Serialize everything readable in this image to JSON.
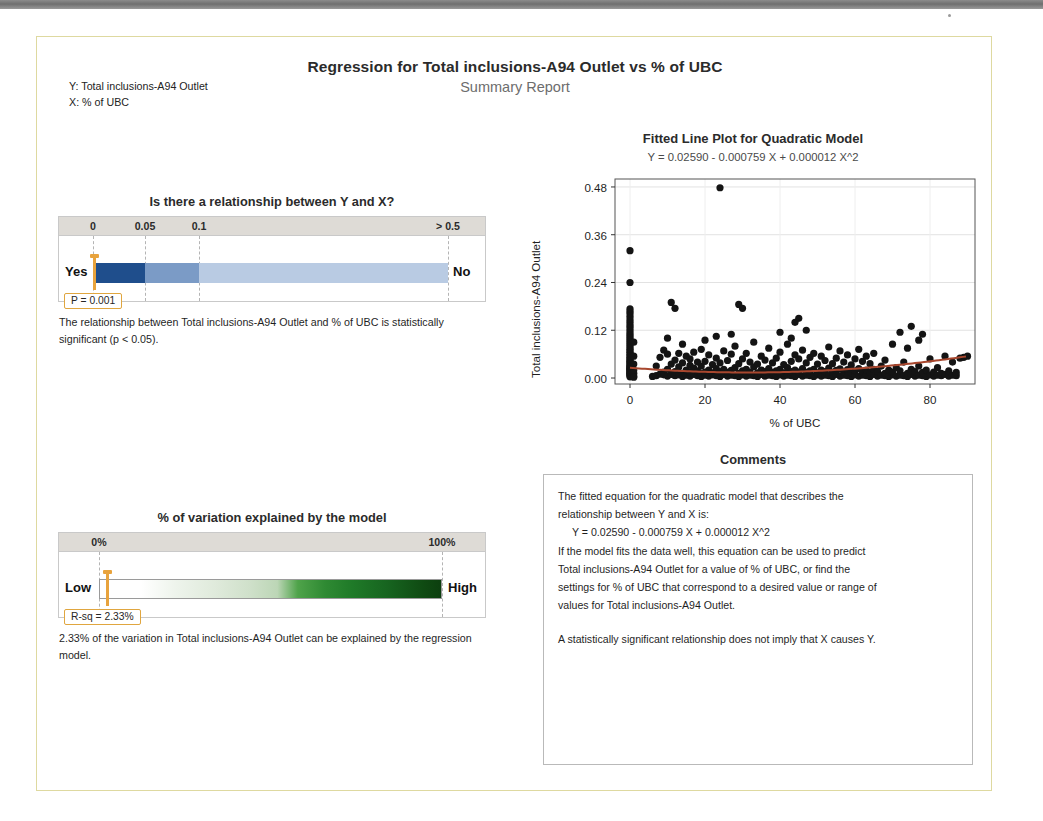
{
  "header": {
    "title": "Regression for Total inclusions-A94 Outlet vs % of UBC",
    "subtitle": "Summary Report",
    "y_label": "Y: Total inclusions-A94 Outlet",
    "x_label": "X: % of UBC"
  },
  "relationship_panel": {
    "title": "Is there a relationship between Y and X?",
    "scale_labels": [
      "0",
      "0.05",
      "0.1",
      "> 0.5"
    ],
    "left_end": "Yes",
    "right_end": "No",
    "callout": "P = 0.001",
    "p_value": 0.001,
    "blurb": "The relationship between Total inclusions-A94 Outlet and % of UBC is statistically significant (p < 0.05).",
    "colors": {
      "segment_dark": "#1f4e8c",
      "segment_mid": "#7b9bc6",
      "segment_light": "#b9cbe3",
      "marker": "#e8a33d",
      "header_band": "#dedbd6"
    }
  },
  "variation_panel": {
    "title": "% of variation explained by the model",
    "scale_labels": [
      "0%",
      "100%"
    ],
    "left_end": "Low",
    "right_end": "High",
    "callout": "R-sq = 2.33%",
    "r_squared_percent": 2.33,
    "blurb": "2.33% of the variation in Total inclusions-A94 Outlet can be explained by the regression model.",
    "colors": {
      "gradient_start": "#ffffff",
      "gradient_end": "#0f4a12",
      "marker": "#e8a33d"
    }
  },
  "comments_panel": {
    "title": "Comments",
    "line1": "The fitted equation for the quadratic model that describes the",
    "line2": "relationship between Y and X is:",
    "equation": "Y = 0.02590 - 0.000759 X + 0.000012 X^2",
    "line3": "If the model fits the data well, this equation can be used to predict",
    "line4": "Total inclusions-A94 Outlet for a value of % of UBC, or find the",
    "line5": "settings for % of UBC that correspond to a desired value or range of",
    "line6": "values for Total inclusions-A94 Outlet.",
    "line7": "A statistically significant relationship does not imply that X causes Y."
  },
  "chart_data": {
    "type": "scatter",
    "title": "Fitted Line Plot for Quadratic Model",
    "subtitle": "Y = 0.02590 - 0.000759 X + 0.000012 X^2",
    "xlabel": "% of UBC",
    "ylabel": "Total inclusions-A94 Outlet",
    "xlim": [
      -4,
      92
    ],
    "ylim": [
      -0.015,
      0.5
    ],
    "xticks": [
      0,
      20,
      40,
      60,
      80
    ],
    "yticks": [
      0.0,
      0.12,
      0.24,
      0.36,
      0.48
    ],
    "ytick_labels": [
      "0.00",
      "0.12",
      "0.24",
      "0.36",
      "0.48"
    ],
    "xtick_labels": [
      "0",
      "20",
      "40",
      "60",
      "80"
    ],
    "grid": true,
    "legend": "none",
    "fit": {
      "kind": "quadratic",
      "intercept": 0.0259,
      "linear": -0.000759,
      "quadratic": 1.2e-05,
      "color": "#a8472e"
    },
    "marker": {
      "shape": "circle",
      "color": "#141414",
      "size": 6
    },
    "points": [
      [
        0,
        0.003
      ],
      [
        0,
        0.006
      ],
      [
        0,
        0.008
      ],
      [
        0,
        0.01
      ],
      [
        0,
        0.012
      ],
      [
        0,
        0.014
      ],
      [
        0,
        0.016
      ],
      [
        0,
        0.018
      ],
      [
        0,
        0.02
      ],
      [
        0,
        0.022
      ],
      [
        0,
        0.024
      ],
      [
        0,
        0.026
      ],
      [
        0,
        0.028
      ],
      [
        0,
        0.03
      ],
      [
        0,
        0.033
      ],
      [
        0,
        0.036
      ],
      [
        0,
        0.039
      ],
      [
        0,
        0.042
      ],
      [
        0,
        0.045
      ],
      [
        0,
        0.048
      ],
      [
        0,
        0.052
      ],
      [
        0,
        0.056
      ],
      [
        0,
        0.06
      ],
      [
        0,
        0.064
      ],
      [
        0,
        0.068
      ],
      [
        0,
        0.072
      ],
      [
        0,
        0.077
      ],
      [
        0,
        0.082
      ],
      [
        0,
        0.087
      ],
      [
        0,
        0.092
      ],
      [
        0,
        0.097
      ],
      [
        0,
        0.102
      ],
      [
        0,
        0.107
      ],
      [
        0,
        0.112
      ],
      [
        0,
        0.118
      ],
      [
        0,
        0.124
      ],
      [
        0,
        0.13
      ],
      [
        0,
        0.136
      ],
      [
        0,
        0.142
      ],
      [
        0,
        0.148
      ],
      [
        0,
        0.155
      ],
      [
        0,
        0.162
      ],
      [
        0,
        0.168
      ],
      [
        0,
        0.174
      ],
      [
        0,
        0.24
      ],
      [
        0,
        0.32
      ],
      [
        1,
        0.005
      ],
      [
        1,
        0.012
      ],
      [
        1,
        0.02
      ],
      [
        1,
        0.035
      ],
      [
        1,
        0.055
      ],
      [
        1,
        0.09
      ],
      [
        1,
        0.002
      ],
      [
        6,
        0.004
      ],
      [
        7,
        0.006
      ],
      [
        7,
        0.03
      ],
      [
        8,
        0.01
      ],
      [
        8,
        0.052
      ],
      [
        9,
        0.008
      ],
      [
        9,
        0.07
      ],
      [
        9,
        0.015
      ],
      [
        10,
        0.005
      ],
      [
        10,
        0.022
      ],
      [
        10,
        0.06
      ],
      [
        10,
        0.1
      ],
      [
        11,
        0.009
      ],
      [
        11,
        0.035
      ],
      [
        11,
        0.19
      ],
      [
        12,
        0.006
      ],
      [
        12,
        0.016
      ],
      [
        12,
        0.045
      ],
      [
        12,
        0.175
      ],
      [
        13,
        0.008
      ],
      [
        13,
        0.028
      ],
      [
        13,
        0.062
      ],
      [
        14,
        0.004
      ],
      [
        14,
        0.012
      ],
      [
        14,
        0.038
      ],
      [
        14,
        0.085
      ],
      [
        15,
        0.007
      ],
      [
        15,
        0.02
      ],
      [
        15,
        0.055
      ],
      [
        16,
        0.005
      ],
      [
        16,
        0.014
      ],
      [
        16,
        0.032
      ],
      [
        16,
        0.048
      ],
      [
        17,
        0.009
      ],
      [
        17,
        0.025
      ],
      [
        17,
        0.065
      ],
      [
        18,
        0.006
      ],
      [
        18,
        0.018
      ],
      [
        18,
        0.04
      ],
      [
        19,
        0.004
      ],
      [
        19,
        0.011
      ],
      [
        19,
        0.03
      ],
      [
        19,
        0.072
      ],
      [
        20,
        0.007
      ],
      [
        20,
        0.015
      ],
      [
        20,
        0.042
      ],
      [
        20,
        0.095
      ],
      [
        21,
        0.005
      ],
      [
        21,
        0.02
      ],
      [
        21,
        0.058
      ],
      [
        22,
        0.008
      ],
      [
        22,
        0.013
      ],
      [
        22,
        0.034
      ],
      [
        23,
        0.006
      ],
      [
        23,
        0.024
      ],
      [
        23,
        0.05
      ],
      [
        23,
        0.105
      ],
      [
        24,
        0.004
      ],
      [
        24,
        0.016
      ],
      [
        24,
        0.038
      ],
      [
        24,
        0.478
      ],
      [
        25,
        0.009
      ],
      [
        25,
        0.022
      ],
      [
        25,
        0.068
      ],
      [
        26,
        0.005
      ],
      [
        26,
        0.014
      ],
      [
        26,
        0.044
      ],
      [
        27,
        0.007
      ],
      [
        27,
        0.019
      ],
      [
        27,
        0.06
      ],
      [
        27,
        0.11
      ],
      [
        28,
        0.006
      ],
      [
        28,
        0.026
      ],
      [
        28,
        0.08
      ],
      [
        29,
        0.004
      ],
      [
        29,
        0.012
      ],
      [
        29,
        0.036
      ],
      [
        29,
        0.185
      ],
      [
        30,
        0.008
      ],
      [
        30,
        0.018
      ],
      [
        30,
        0.048
      ],
      [
        30,
        0.175
      ],
      [
        31,
        0.005
      ],
      [
        31,
        0.022
      ],
      [
        31,
        0.062
      ],
      [
        32,
        0.007
      ],
      [
        32,
        0.015
      ],
      [
        32,
        0.04
      ],
      [
        33,
        0.006
      ],
      [
        33,
        0.028
      ],
      [
        33,
        0.09
      ],
      [
        34,
        0.004
      ],
      [
        34,
        0.013
      ],
      [
        34,
        0.035
      ],
      [
        35,
        0.009
      ],
      [
        35,
        0.02
      ],
      [
        35,
        0.055
      ],
      [
        36,
        0.005
      ],
      [
        36,
        0.016
      ],
      [
        36,
        0.045
      ],
      [
        37,
        0.007
      ],
      [
        37,
        0.024
      ],
      [
        37,
        0.075
      ],
      [
        38,
        0.006
      ],
      [
        38,
        0.014
      ],
      [
        38,
        0.038
      ],
      [
        39,
        0.004
      ],
      [
        39,
        0.018
      ],
      [
        39,
        0.05
      ],
      [
        40,
        0.008
      ],
      [
        40,
        0.022
      ],
      [
        40,
        0.065
      ],
      [
        40,
        0.115
      ],
      [
        41,
        0.005
      ],
      [
        41,
        0.013
      ],
      [
        41,
        0.034
      ],
      [
        42,
        0.007
      ],
      [
        42,
        0.026
      ],
      [
        42,
        0.085
      ],
      [
        43,
        0.006
      ],
      [
        43,
        0.016
      ],
      [
        43,
        0.042
      ],
      [
        43,
        0.1
      ],
      [
        44,
        0.004
      ],
      [
        44,
        0.02
      ],
      [
        44,
        0.058
      ],
      [
        44,
        0.14
      ],
      [
        45,
        0.009
      ],
      [
        45,
        0.015
      ],
      [
        45,
        0.048
      ],
      [
        45,
        0.15
      ],
      [
        46,
        0.005
      ],
      [
        46,
        0.024
      ],
      [
        46,
        0.07
      ],
      [
        47,
        0.007
      ],
      [
        47,
        0.014
      ],
      [
        47,
        0.038
      ],
      [
        47,
        0.12
      ],
      [
        48,
        0.006
      ],
      [
        48,
        0.018
      ],
      [
        48,
        0.052
      ],
      [
        49,
        0.004
      ],
      [
        49,
        0.022
      ],
      [
        49,
        0.062
      ],
      [
        50,
        0.008
      ],
      [
        50,
        0.013
      ],
      [
        50,
        0.035
      ],
      [
        51,
        0.005
      ],
      [
        51,
        0.02
      ],
      [
        51,
        0.055
      ],
      [
        52,
        0.007
      ],
      [
        52,
        0.016
      ],
      [
        52,
        0.044
      ],
      [
        53,
        0.006
      ],
      [
        53,
        0.025
      ],
      [
        53,
        0.078
      ],
      [
        54,
        0.004
      ],
      [
        54,
        0.014
      ],
      [
        54,
        0.036
      ],
      [
        55,
        0.009
      ],
      [
        55,
        0.019
      ],
      [
        55,
        0.05
      ],
      [
        56,
        0.005
      ],
      [
        56,
        0.023
      ],
      [
        56,
        0.068
      ],
      [
        57,
        0.007
      ],
      [
        57,
        0.015
      ],
      [
        57,
        0.04
      ],
      [
        58,
        0.006
      ],
      [
        58,
        0.021
      ],
      [
        58,
        0.058
      ],
      [
        59,
        0.004
      ],
      [
        59,
        0.013
      ],
      [
        59,
        0.033
      ],
      [
        60,
        0.008
      ],
      [
        60,
        0.018
      ],
      [
        60,
        0.048
      ],
      [
        61,
        0.005
      ],
      [
        61,
        0.024
      ],
      [
        61,
        0.072
      ],
      [
        62,
        0.007
      ],
      [
        62,
        0.016
      ],
      [
        62,
        0.042
      ],
      [
        63,
        0.006
      ],
      [
        63,
        0.02
      ],
      [
        63,
        0.055
      ],
      [
        64,
        0.004
      ],
      [
        64,
        0.014
      ],
      [
        64,
        0.036
      ],
      [
        65,
        0.009
      ],
      [
        65,
        0.022
      ],
      [
        65,
        0.062
      ],
      [
        66,
        0.005
      ],
      [
        66,
        0.017
      ],
      [
        67,
        0.007
      ],
      [
        67,
        0.03
      ],
      [
        68,
        0.006
      ],
      [
        68,
        0.012
      ],
      [
        68,
        0.045
      ],
      [
        69,
        0.004
      ],
      [
        69,
        0.02
      ],
      [
        70,
        0.008
      ],
      [
        70,
        0.015
      ],
      [
        70,
        0.085
      ],
      [
        71,
        0.005
      ],
      [
        71,
        0.026
      ],
      [
        72,
        0.007
      ],
      [
        72,
        0.018
      ],
      [
        72,
        0.115
      ],
      [
        73,
        0.006
      ],
      [
        73,
        0.04
      ],
      [
        74,
        0.004
      ],
      [
        74,
        0.012
      ],
      [
        74,
        0.075
      ],
      [
        75,
        0.009
      ],
      [
        75,
        0.022
      ],
      [
        75,
        0.13
      ],
      [
        76,
        0.005
      ],
      [
        76,
        0.016
      ],
      [
        77,
        0.007
      ],
      [
        77,
        0.03
      ],
      [
        77,
        0.095
      ],
      [
        78,
        0.006
      ],
      [
        78,
        0.014
      ],
      [
        78,
        0.11
      ],
      [
        79,
        0.004
      ],
      [
        79,
        0.02
      ],
      [
        80,
        0.008
      ],
      [
        80,
        0.048
      ],
      [
        81,
        0.005
      ],
      [
        81,
        0.015
      ],
      [
        82,
        0.007
      ],
      [
        82,
        0.026
      ],
      [
        83,
        0.006
      ],
      [
        83,
        0.012
      ],
      [
        84,
        0.009
      ],
      [
        84,
        0.055
      ],
      [
        85,
        0.005
      ],
      [
        85,
        0.018
      ],
      [
        86,
        0.007
      ],
      [
        86,
        0.04
      ],
      [
        87,
        0.006
      ],
      [
        87,
        0.014
      ],
      [
        88,
        0.05
      ],
      [
        89,
        0.052
      ],
      [
        90,
        0.055
      ]
    ]
  }
}
